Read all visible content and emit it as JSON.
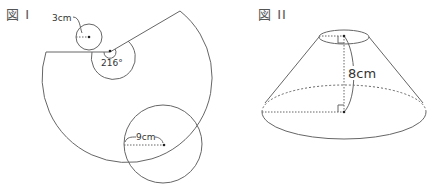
{
  "figure1": {
    "title": "図 I",
    "small_circle_radius_label": "3cm",
    "angle_label": "216°",
    "large_circle_radius_label": "9cm"
  },
  "figure2": {
    "title": "図 II",
    "height_label": "8cm"
  },
  "colors": {
    "line": "#555555",
    "text": "#333333"
  }
}
